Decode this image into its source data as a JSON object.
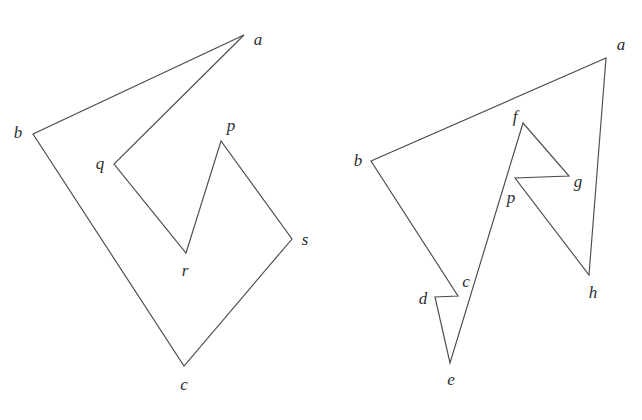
{
  "figure": {
    "background_color": "#ffffff",
    "stroke_color": "#4a4a52",
    "label_color": "#2d2d33",
    "width": 642,
    "height": 420,
    "panels": [
      {
        "id": "left-polygon",
        "name": "left-polygon",
        "description": "Seven-vertex simple polygon with notch at q-r-p",
        "vertex_order": [
          "a",
          "b",
          "c",
          "s",
          "p",
          "r",
          "q"
        ],
        "path": "M 244 35 L 33 134 L 184 366 L 292 239 L 221 141 L 186 253 L 114 164 Z",
        "vertices": [
          {
            "id": "a",
            "label": "a",
            "x": 244,
            "y": 35,
            "label_x": 258,
            "label_y": 39
          },
          {
            "id": "b",
            "label": "b",
            "x": 33,
            "y": 134,
            "label_x": 18,
            "label_y": 132
          },
          {
            "id": "c",
            "label": "c",
            "x": 184,
            "y": 366,
            "label_x": 184,
            "label_y": 384
          },
          {
            "id": "s",
            "label": "s",
            "x": 292,
            "y": 239,
            "label_x": 305,
            "label_y": 239
          },
          {
            "id": "p",
            "label": "p",
            "x": 221,
            "y": 141,
            "label_x": 231,
            "label_y": 125
          },
          {
            "id": "r",
            "label": "r",
            "x": 186,
            "y": 253,
            "label_x": 185,
            "label_y": 270
          },
          {
            "id": "q",
            "label": "q",
            "x": 114,
            "y": 164,
            "label_x": 100,
            "label_y": 163
          }
        ]
      },
      {
        "id": "right-polygon",
        "name": "right-polygon",
        "description": "Eight-vertex self-notched polygon with spikes at c-d-e and f-g-p",
        "vertex_order": [
          "a",
          "b",
          "c",
          "d",
          "e",
          "f",
          "g",
          "p",
          "h"
        ],
        "path": "M 606 58 L 371 161 L 458 296 L 435 297 L 450 363 L 523 123 L 569 176 L 515 178 L 589 275 Z",
        "vertices": [
          {
            "id": "a",
            "label": "a",
            "x": 606,
            "y": 58,
            "label_x": 621,
            "label_y": 44
          },
          {
            "id": "b",
            "label": "b",
            "x": 371,
            "y": 161,
            "label_x": 358,
            "label_y": 160
          },
          {
            "id": "c",
            "label": "c",
            "x": 458,
            "y": 296,
            "label_x": 466,
            "label_y": 281
          },
          {
            "id": "d",
            "label": "d",
            "x": 435,
            "y": 297,
            "label_x": 423,
            "label_y": 298
          },
          {
            "id": "e",
            "label": "e",
            "x": 450,
            "y": 363,
            "label_x": 451,
            "label_y": 379
          },
          {
            "id": "f",
            "label": "f",
            "x": 523,
            "y": 123,
            "label_x": 515,
            "label_y": 116
          },
          {
            "id": "g",
            "label": "g",
            "x": 569,
            "y": 176,
            "label_x": 578,
            "label_y": 181
          },
          {
            "id": "p",
            "label": "p",
            "x": 515,
            "y": 178,
            "label_x": 511,
            "label_y": 197
          },
          {
            "id": "h",
            "label": "h",
            "x": 589,
            "y": 275,
            "label_x": 593,
            "label_y": 292
          }
        ]
      }
    ]
  }
}
